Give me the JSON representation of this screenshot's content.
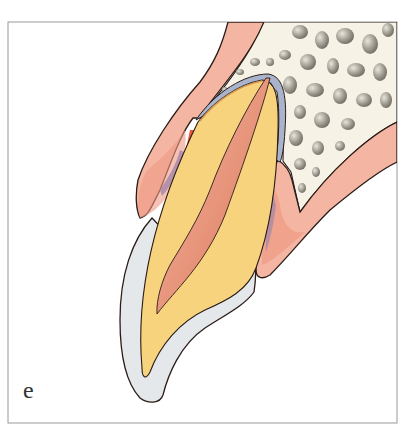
{
  "figure": {
    "panel_label": "e",
    "colors": {
      "background": "#ffffff",
      "frame": "#9a9a9a",
      "outline": "#2a1c18",
      "gingiva": "#f4b5a2",
      "gingiva_inflamed": "#ee8f78",
      "gingiva_red": "#e8553a",
      "gingiva_purple": "#a98aa8",
      "bone": "#f6f3e6",
      "bone_pore": "#8d8a80",
      "enamel": "#e4e8ea",
      "dentin": "#f8d37e",
      "pulp": "#ec9a80",
      "pulp_dark": "#de7860",
      "periodontal_ligament": "#a9b4cc",
      "cementum": "#d79a55"
    }
  }
}
